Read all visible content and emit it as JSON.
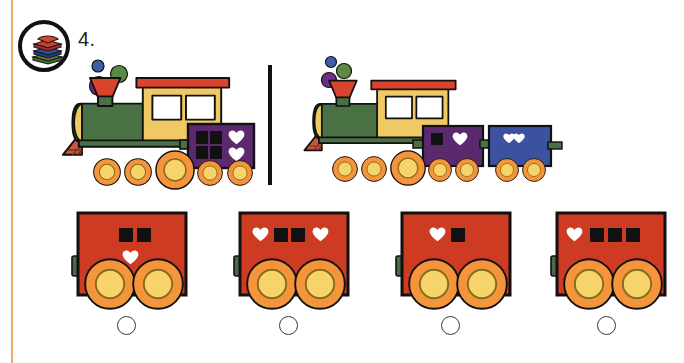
{
  "worksheet": {
    "question_number": "4.",
    "badge_icon": "book-stack-icon",
    "divider": "vertical-rule"
  },
  "colors": {
    "rule": "#f0a868",
    "engine_body": "#4a7144",
    "cabin": "#efc964",
    "roof": "#d9442c",
    "funnel": "#d9442c",
    "wheel_outer": "#f4953c",
    "wheel_inner": "#f7d46a",
    "wagon_purple": "#5b2a6e",
    "wagon_blue": "#3c52a0",
    "wagon_red": "#cc3b22",
    "smoke_blue": "#3b5fa8",
    "smoke_green": "#5b8a45",
    "smoke_purple": "#6b2f86",
    "outline": "#111111",
    "heart": "#ffffff",
    "square": "#111111"
  },
  "prompt_trains": [
    {
      "name": "train-left",
      "engine": "green-steam-engine",
      "smoke_puffs": 3,
      "wagons": [
        {
          "color": "purple",
          "symbols": [
            "square",
            "square",
            "square",
            "square",
            "heart",
            "heart"
          ],
          "layout": "2x2-squares-plus-2-hearts",
          "square_count": 4,
          "heart_count": 2
        }
      ]
    },
    {
      "name": "train-right",
      "engine": "green-steam-engine",
      "smoke_puffs": 3,
      "wagons": [
        {
          "color": "purple",
          "symbols": [
            "square",
            "heart"
          ],
          "layout": "one-row",
          "square_count": 1,
          "heart_count": 1
        },
        {
          "color": "blue",
          "symbols": [
            "heart",
            "heart"
          ],
          "layout": "one-row",
          "square_count": 0,
          "heart_count": 2
        }
      ]
    }
  ],
  "options": [
    {
      "id": "option-a",
      "color": "red",
      "rows": [
        [
          "square",
          "square"
        ],
        [
          "heart"
        ]
      ],
      "square_count": 2,
      "heart_count": 1,
      "selected": false
    },
    {
      "id": "option-b",
      "color": "red",
      "rows": [
        [
          "heart",
          "square",
          "square",
          "heart"
        ]
      ],
      "square_count": 2,
      "heart_count": 2,
      "selected": false
    },
    {
      "id": "option-c",
      "color": "red",
      "rows": [
        [
          "heart",
          "square"
        ]
      ],
      "square_count": 1,
      "heart_count": 1,
      "selected": false
    },
    {
      "id": "option-d",
      "color": "red",
      "rows": [
        [
          "heart",
          "square",
          "square",
          "square"
        ]
      ],
      "square_count": 3,
      "heart_count": 1,
      "selected": false
    }
  ]
}
